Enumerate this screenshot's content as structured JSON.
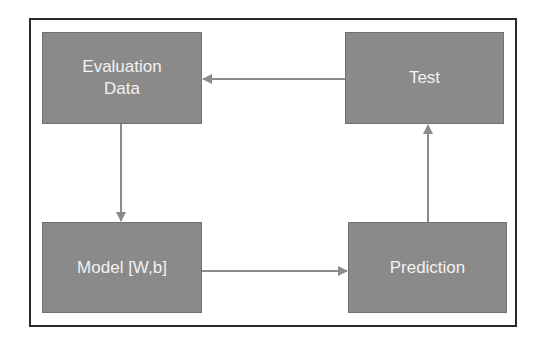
{
  "diagram": {
    "type": "flowchart-cycle",
    "colors": {
      "node_fill": "#8a8a8a",
      "node_text": "#f2f2f2",
      "edge": "#8c8c8c",
      "frame": "#2a2a2a",
      "background": "#ffffff"
    },
    "nodes": [
      {
        "id": "eval",
        "label": "Evaluation\nData"
      },
      {
        "id": "test",
        "label": "Test"
      },
      {
        "id": "model",
        "label": "Model [W,b]"
      },
      {
        "id": "prediction",
        "label": "Prediction"
      }
    ],
    "edges": [
      {
        "from": "eval",
        "to": "model",
        "direction": "down"
      },
      {
        "from": "model",
        "to": "prediction",
        "direction": "right"
      },
      {
        "from": "prediction",
        "to": "test",
        "direction": "up"
      },
      {
        "from": "test",
        "to": "eval",
        "direction": "left"
      }
    ]
  }
}
